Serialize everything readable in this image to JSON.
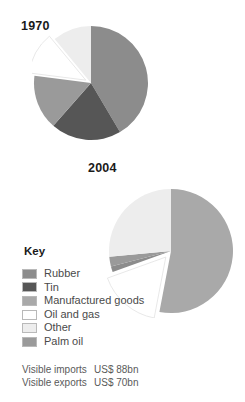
{
  "charts": [
    {
      "id": "pie-1970",
      "title": "1970"
    },
    {
      "id": "pie-2004",
      "title": "2004"
    }
  ],
  "key": {
    "title": "Key",
    "items": [
      {
        "label": "Rubber",
        "color": "#8c8c8c"
      },
      {
        "label": "Tin",
        "color": "#565656"
      },
      {
        "label": "Manufactured goods",
        "color": "#a9a9a9"
      },
      {
        "label": "Oil and gas",
        "color": "#ffffff"
      },
      {
        "label": "Other",
        "color": "#ededed"
      },
      {
        "label": "Palm oil",
        "color": "#9a9a9a"
      }
    ]
  },
  "notes": [
    {
      "label": "Visible imports",
      "value": "US$ 88bn"
    },
    {
      "label": "Visible exports",
      "value": "US$ 70bn"
    }
  ],
  "chart_data": [
    {
      "type": "pie",
      "title": "1970",
      "unit": "percent of visible exports",
      "start_angle_deg": 0,
      "direction": "clockwise",
      "categories": [
        "Rubber",
        "Tin",
        "Palm oil",
        "Oil and gas",
        "Other"
      ],
      "values": [
        41.5,
        20.0,
        15.5,
        12.0,
        11.0
      ],
      "colors": [
        "#8c8c8c",
        "#565656",
        "#9a9a9a",
        "#ffffff",
        "#ededed"
      ],
      "exploded": [
        "Oil and gas"
      ],
      "legend": "shared-key",
      "grid": false
    },
    {
      "type": "pie",
      "title": "2004",
      "unit": "percent of visible exports",
      "start_angle_deg": 0,
      "direction": "clockwise",
      "categories": [
        "Manufactured goods",
        "Oil and gas",
        "Rubber",
        "Palm oil",
        "Other"
      ],
      "values": [
        53.0,
        16.5,
        1.5,
        2.5,
        26.5
      ],
      "colors": [
        "#a9a9a9",
        "#ffffff",
        "#8c8c8c",
        "#9a9a9a",
        "#ededed"
      ],
      "exploded": [
        "Oil and gas"
      ],
      "legend": "shared-key",
      "grid": false
    }
  ]
}
